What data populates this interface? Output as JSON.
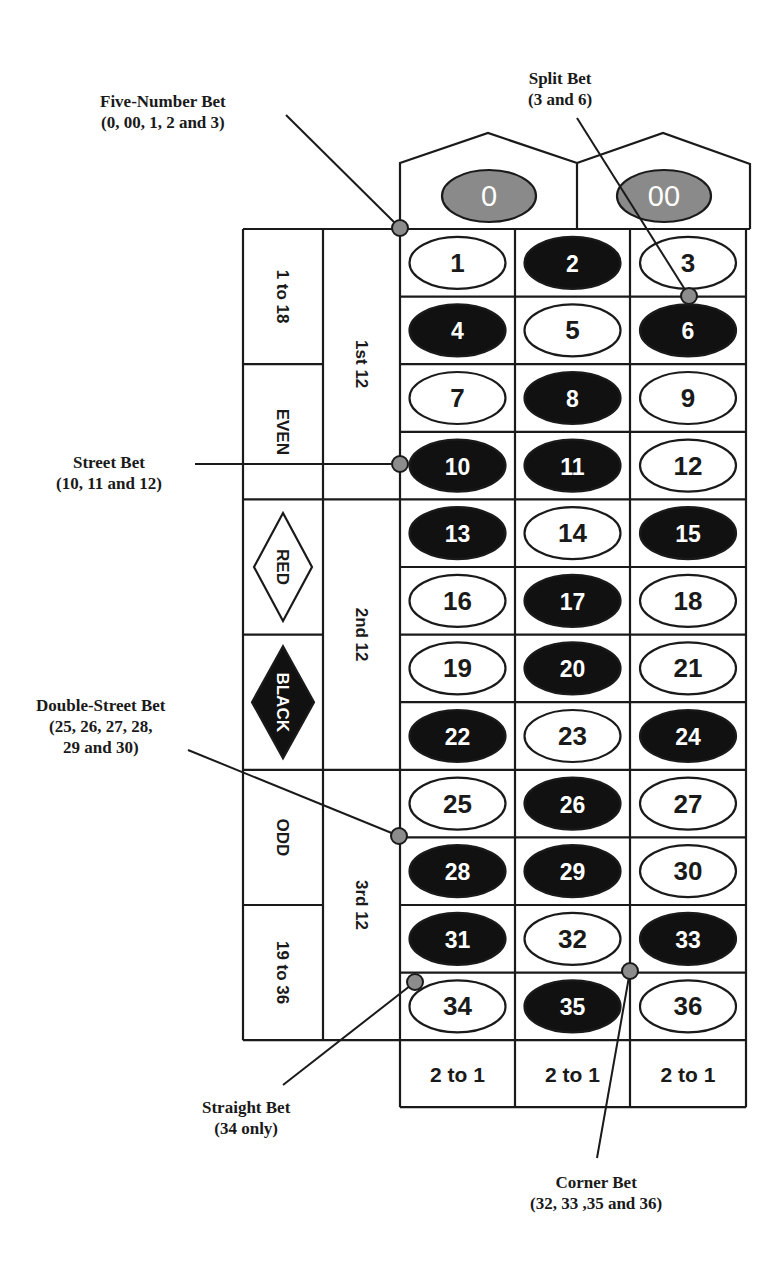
{
  "colors": {
    "line": "#1a1a1a",
    "black_pocket": "#111111",
    "red_pocket": "#ffffff",
    "green_pocket": "#8a8a8a",
    "marker": "#8c8c8c"
  },
  "zeros": [
    {
      "label": "0"
    },
    {
      "label": "00"
    }
  ],
  "numbers": [
    {
      "n": "1",
      "color": "red"
    },
    {
      "n": "2",
      "color": "black"
    },
    {
      "n": "3",
      "color": "red"
    },
    {
      "n": "4",
      "color": "black"
    },
    {
      "n": "5",
      "color": "red"
    },
    {
      "n": "6",
      "color": "black"
    },
    {
      "n": "7",
      "color": "red"
    },
    {
      "n": "8",
      "color": "black"
    },
    {
      "n": "9",
      "color": "red"
    },
    {
      "n": "10",
      "color": "black"
    },
    {
      "n": "11",
      "color": "black"
    },
    {
      "n": "12",
      "color": "red"
    },
    {
      "n": "13",
      "color": "black"
    },
    {
      "n": "14",
      "color": "red"
    },
    {
      "n": "15",
      "color": "black"
    },
    {
      "n": "16",
      "color": "red"
    },
    {
      "n": "17",
      "color": "black"
    },
    {
      "n": "18",
      "color": "red"
    },
    {
      "n": "19",
      "color": "red"
    },
    {
      "n": "20",
      "color": "black"
    },
    {
      "n": "21",
      "color": "red"
    },
    {
      "n": "22",
      "color": "black"
    },
    {
      "n": "23",
      "color": "red"
    },
    {
      "n": "24",
      "color": "black"
    },
    {
      "n": "25",
      "color": "red"
    },
    {
      "n": "26",
      "color": "black"
    },
    {
      "n": "27",
      "color": "red"
    },
    {
      "n": "28",
      "color": "black"
    },
    {
      "n": "29",
      "color": "black"
    },
    {
      "n": "30",
      "color": "red"
    },
    {
      "n": "31",
      "color": "black"
    },
    {
      "n": "32",
      "color": "red"
    },
    {
      "n": "33",
      "color": "black"
    },
    {
      "n": "34",
      "color": "red"
    },
    {
      "n": "35",
      "color": "black"
    },
    {
      "n": "36",
      "color": "red"
    }
  ],
  "outside_bets": [
    {
      "label": "1 to 18",
      "type": "text"
    },
    {
      "label": "EVEN",
      "type": "text"
    },
    {
      "label": "RED",
      "type": "diamond-outline"
    },
    {
      "label": "BLACK",
      "type": "diamond-filled"
    },
    {
      "label": "ODD",
      "type": "text"
    },
    {
      "label": "19 to 36",
      "type": "text"
    }
  ],
  "dozens": [
    {
      "label": "1st  12"
    },
    {
      "label": "2nd  12"
    },
    {
      "label": "3rd  12"
    }
  ],
  "columns": [
    {
      "label": "2 to 1"
    },
    {
      "label": "2 to 1"
    },
    {
      "label": "2 to 1"
    }
  ],
  "callouts": {
    "five_number": {
      "title": "Five-Number Bet",
      "detail": "(0, 00, 1, 2 and 3)"
    },
    "split": {
      "title": "Split Bet",
      "detail": "(3 and 6)"
    },
    "street": {
      "title": "Street Bet",
      "detail": "(10, 11 and 12)"
    },
    "double_street": {
      "title": "Double-Street Bet",
      "detail1": "(25, 26, 27, 28,",
      "detail2": "29 and 30)"
    },
    "straight": {
      "title": "Straight Bet",
      "detail": "(34 only)"
    },
    "corner": {
      "title": "Corner Bet",
      "detail": "(32, 33 ,35 and 36)"
    }
  }
}
